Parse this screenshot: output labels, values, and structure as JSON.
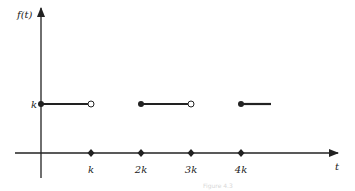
{
  "chart_data": {
    "type": "line",
    "title": "",
    "ylabel": "f(t)",
    "xlabel": "t",
    "x_ticks": [
      {
        "value": 1,
        "label": "k"
      },
      {
        "value": 2,
        "label": "2k"
      },
      {
        "value": 3,
        "label": "3k"
      },
      {
        "value": 4,
        "label": "4k"
      }
    ],
    "y_ticks": [
      {
        "value": 1,
        "label": "k"
      }
    ],
    "xlim": [
      -0.1,
      5.9
    ],
    "ylim": [
      -0.5,
      2.0
    ],
    "segments": [
      {
        "x_start": 0,
        "x_end": 1,
        "y": 1,
        "start_closed": true,
        "end_closed": false
      },
      {
        "x_start": 2,
        "x_end": 3,
        "y": 1,
        "start_closed": true,
        "end_closed": false
      },
      {
        "x_start": 4,
        "x_end": 4.6,
        "y": 1,
        "start_closed": true,
        "end_closed": null
      }
    ],
    "caption": "Figure 4.3"
  }
}
